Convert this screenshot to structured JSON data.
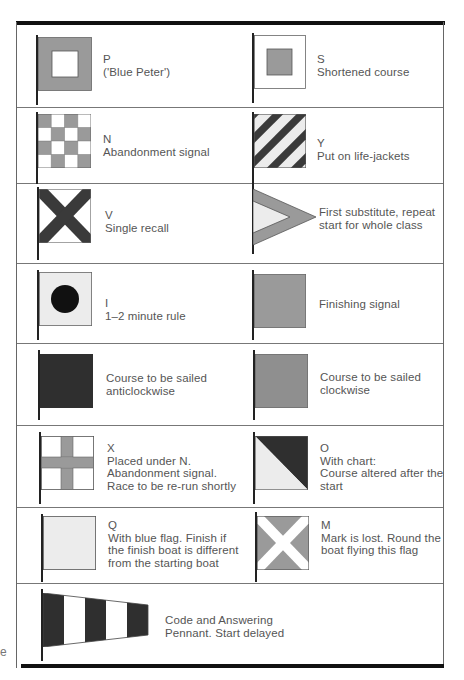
{
  "colors": {
    "grey": "#9a9a9a",
    "dark": "#3a3a3a",
    "black": "#111111",
    "light": "#ececec",
    "white": "#ffffff"
  },
  "rows": [
    {
      "left": {
        "flag": "P",
        "flag_icon": "p-blue-peter-flag-icon",
        "lines": [
          "P",
          "('Blue Peter')"
        ]
      },
      "right": {
        "flag": "S",
        "flag_icon": "s-flag-icon",
        "lines": [
          "S",
          "Shortened course"
        ]
      }
    },
    {
      "left": {
        "flag": "N",
        "flag_icon": "n-checkered-flag-icon",
        "lines": [
          "N",
          "Abandonment signal"
        ]
      },
      "right": {
        "flag": "Y",
        "flag_icon": "y-diagonal-stripes-flag-icon",
        "lines": [
          "Y",
          "Put on life-jackets"
        ]
      }
    },
    {
      "left": {
        "flag": "V",
        "flag_icon": "v-saltire-flag-icon",
        "lines": [
          "V",
          "Single recall"
        ]
      },
      "right": {
        "flag": "First substitute",
        "flag_icon": "first-substitute-pennant-icon",
        "lines": [
          "First substitute, repeat",
          "start for whole class"
        ]
      }
    },
    {
      "left": {
        "flag": "I",
        "flag_icon": "i-circle-flag-icon",
        "lines": [
          "I",
          "1–2 minute rule"
        ]
      },
      "right": {
        "flag": "Finishing",
        "flag_icon": "finishing-flag-icon",
        "lines": [
          "Finishing signal"
        ]
      }
    },
    {
      "left": {
        "flag": "Anticlockwise",
        "flag_icon": "dark-square-flag-icon",
        "lines": [
          "Course to be sailed",
          "anticlockwise"
        ]
      },
      "right": {
        "flag": "Clockwise",
        "flag_icon": "grey-square-flag-icon",
        "lines": [
          "Course to be sailed",
          "clockwise"
        ]
      }
    },
    {
      "left": {
        "flag": "X",
        "flag_icon": "x-cross-flag-icon",
        "lines": [
          "X",
          "Placed under N.",
          "Abandonment signal.",
          "Race to be re-run shortly"
        ]
      },
      "right": {
        "flag": "O",
        "flag_icon": "o-diagonal-half-flag-icon",
        "lines": [
          "O",
          "With chart:",
          "Course altered after the",
          "start"
        ]
      }
    },
    {
      "left": {
        "flag": "Q",
        "flag_icon": "q-plain-flag-icon",
        "lines": [
          "Q",
          "With blue flag. Finish if",
          "the finish boat is different",
          "from the starting boat"
        ]
      },
      "right": {
        "flag": "M",
        "flag_icon": "m-white-saltire-flag-icon",
        "lines": [
          "M",
          "Mark is lost. Round the",
          "boat flying this flag"
        ]
      }
    },
    {
      "full": {
        "flag": "Code and Answering Pennant",
        "flag_icon": "answering-pennant-icon",
        "lines": [
          "Code and Answering",
          "Pennant. Start delayed"
        ]
      }
    }
  ],
  "margin_fragment": "e"
}
